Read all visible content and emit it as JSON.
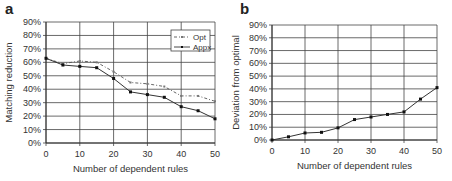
{
  "chart_data": [
    {
      "panel": "a",
      "type": "line",
      "title": "",
      "xlabel": "Number of dependent rules",
      "ylabel": "Matching reduction",
      "x": [
        0,
        5,
        10,
        15,
        20,
        25,
        30,
        35,
        40,
        45,
        50
      ],
      "xticks": [
        "0",
        "10",
        "20",
        "30",
        "40",
        "50"
      ],
      "yticks": [
        "0%",
        "10%",
        "20%",
        "30%",
        "40%",
        "50%",
        "60%",
        "70%",
        "80%",
        "90%"
      ],
      "xlim": [
        0,
        50
      ],
      "ylim": [
        0,
        90
      ],
      "grid": true,
      "legend_position": "upper right (inside)",
      "series": [
        {
          "name": "Opt",
          "style": "dash-dot",
          "values": [
            63,
            59,
            61,
            60,
            53,
            45,
            44,
            42,
            35,
            35,
            31
          ]
        },
        {
          "name": "Appx",
          "style": "solid-markers",
          "values": [
            63,
            58,
            57,
            56,
            48,
            38,
            36,
            34,
            27,
            24,
            18
          ]
        }
      ]
    },
    {
      "panel": "b",
      "type": "line",
      "title": "",
      "xlabel": "Number of dependent rules",
      "ylabel": "Deviation from optimal",
      "x": [
        0,
        5,
        10,
        15,
        20,
        25,
        30,
        35,
        40,
        45,
        50
      ],
      "xticks": [
        "0",
        "10",
        "20",
        "30",
        "40",
        "50"
      ],
      "yticks": [
        "0%",
        "10%",
        "20%",
        "30%",
        "40%",
        "50%",
        "60%",
        "70%",
        "80%",
        "90%"
      ],
      "xlim": [
        0,
        50
      ],
      "ylim": [
        0,
        90
      ],
      "grid": true,
      "series": [
        {
          "name": "Deviation",
          "style": "solid-markers",
          "values": [
            0,
            2.5,
            5.5,
            6,
            9.5,
            16,
            18,
            20,
            22,
            32,
            41
          ]
        }
      ]
    }
  ],
  "panels": {
    "a": {
      "letter": "a"
    },
    "b": {
      "letter": "b"
    }
  }
}
